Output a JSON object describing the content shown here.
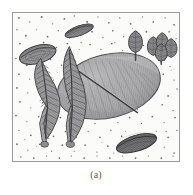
{
  "figure": {
    "caption": "(a)",
    "panel_label": "(a)",
    "frame_color": "#9a9a9a",
    "background_color": "#fbfbfa",
    "page_background": "#ffffff",
    "speckle_color": "#6e6e70",
    "ink_color": "#4a4a4c",
    "fill_light": "#c8c8c8",
    "fill_mid": "#a6a6a6",
    "fill_dark": "#7d7d80",
    "fill_darkest": "#5e5e61",
    "width": 193,
    "height": 195
  },
  "plate": {
    "x": 12,
    "y": 12,
    "width": 168,
    "height": 150
  },
  "specimens": [
    {
      "id": "large-central-leaf",
      "name": "large-leaf",
      "label": "Large elliptical leaf with central midrib and fine radial venation",
      "shape": "ellipse",
      "cx": 97,
      "cy": 74,
      "rx": 53,
      "ry": 32,
      "rotation": -14,
      "fill": "#a6a6a6",
      "stroke": "#4a4a4c"
    },
    {
      "id": "seed-top",
      "name": "seed-elongate-top",
      "label": "Elongate striated seed, upper centre",
      "shape": "ellipse",
      "cx": 67,
      "cy": 18,
      "rx": 15,
      "ry": 5,
      "rotation": -20,
      "fill": "#8b8b8e",
      "stroke": "#3f3f41"
    },
    {
      "id": "shell-left",
      "name": "shell-ovate-left",
      "label": "Broad ovate shell with concentric growth lines, left margin",
      "shape": "ellipse",
      "cx": 25,
      "cy": 42,
      "rx": 19,
      "ry": 9,
      "rotation": -16,
      "fill": "#9a9a9d",
      "stroke": "#3f3f41"
    },
    {
      "id": "seed-bottom-right",
      "name": "seed-elongate-bottom-right",
      "label": "Elongate striated seed, lower right",
      "shape": "ellipse",
      "cx": 125,
      "cy": 132,
      "rx": 21,
      "ry": 8,
      "rotation": -17,
      "fill": "#77777a",
      "stroke": "#3a3a3c"
    },
    {
      "id": "frond-left",
      "name": "fern-frond-left",
      "label": "Pinnate fern frond, curved, left of centre",
      "shape": "frond",
      "fill": "#9d9da0",
      "stroke": "#46464a"
    },
    {
      "id": "frond-right",
      "name": "fern-frond-right",
      "label": "Pinnate fern frond, curved, centre",
      "shape": "frond",
      "fill": "#9d9da0",
      "stroke": "#46464a"
    },
    {
      "id": "cone-single",
      "name": "cone-single",
      "label": "Single stalked cone / bud, upper right",
      "shape": "cone",
      "cx": 124,
      "cy": 29,
      "fill": "#8e8e92",
      "stroke": "#414143"
    },
    {
      "id": "cone-cluster",
      "name": "cone-cluster",
      "label": "Cluster of four stalked cones / buds, upper right corner",
      "shape": "cone-cluster",
      "cx": 150,
      "cy": 35,
      "fill": "#8a8a8e",
      "stroke": "#414143"
    }
  ],
  "background": {
    "name": "sediment-speckle",
    "label": "Speckled sediment matrix of fine dark grains",
    "grain_count": 260
  }
}
